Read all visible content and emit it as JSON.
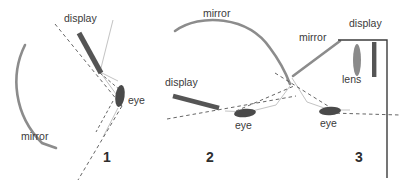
{
  "figure": {
    "colors": {
      "mirror": "#8c8c8c",
      "display": "#555555",
      "eye": "#4a4a4a",
      "lens": "#808080",
      "ray_solid": "#9a9a9a",
      "ray_dashed": "#4a4a4a",
      "housing": "#3c3c3c",
      "text": "#3a3a3a",
      "numeral": "#2e2e2e",
      "background": "#ffffff"
    },
    "panels": [
      {
        "id": "panel-1",
        "numeral": "1",
        "labels": {
          "display": "display",
          "mirror": "mirror",
          "eye": "eye"
        },
        "components": [
          "curved-mirror",
          "display-bar",
          "eye-ellipse"
        ]
      },
      {
        "id": "panel-2",
        "numeral": "2",
        "labels": {
          "mirror": "mirror",
          "display": "display",
          "eye": "eye"
        },
        "components": [
          "curved-mirror",
          "display-bar",
          "eye-ellipse"
        ]
      },
      {
        "id": "panel-3",
        "numeral": "3",
        "labels": {
          "mirror": "mirror",
          "display": "display",
          "lens": "lens",
          "eye": "eye"
        },
        "components": [
          "flat-mirror",
          "lens-ellipse",
          "display-bar",
          "eye-ellipse",
          "housing-outline"
        ]
      }
    ]
  }
}
